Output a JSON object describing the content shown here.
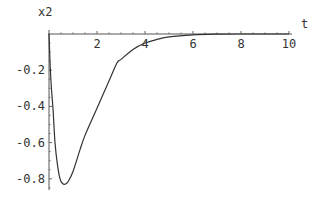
{
  "chart_data": {
    "type": "line",
    "title": "",
    "xlabel": "t",
    "ylabel": "x2",
    "xlim": [
      0,
      10
    ],
    "ylim": [
      -0.86,
      0
    ],
    "grid": false,
    "legend": null,
    "x_ticks": [
      2,
      4,
      6,
      8,
      10
    ],
    "x_tick_labels": [
      "2",
      "4",
      "6",
      "8",
      "10"
    ],
    "y_ticks": [
      -0.2,
      -0.4,
      -0.6,
      -0.8
    ],
    "y_tick_labels": [
      "-0.2",
      "-0.4",
      "-0.6",
      "-0.8"
    ],
    "series": [
      {
        "name": "x2",
        "color": "#333333",
        "x": [
          0,
          0.05,
          0.1,
          0.17,
          0.25,
          0.35,
          0.46,
          0.56,
          0.67,
          0.8,
          1.0,
          1.29,
          1.5,
          2.0,
          2.5,
          2.83,
          3.0,
          3.5,
          4.0,
          4.5,
          5.0,
          6.0,
          7.0,
          8.0,
          9.0,
          10.0
        ],
        "values": [
          0,
          -0.18,
          -0.3,
          -0.42,
          -0.6,
          -0.72,
          -0.8,
          -0.825,
          -0.83,
          -0.815,
          -0.76,
          -0.64,
          -0.56,
          -0.41,
          -0.26,
          -0.16,
          -0.14,
          -0.085,
          -0.05,
          -0.03,
          -0.016,
          -0.005,
          -0.001,
          0,
          0,
          0
        ]
      }
    ]
  },
  "axes": {
    "x_label": "t",
    "y_label": "x2"
  }
}
